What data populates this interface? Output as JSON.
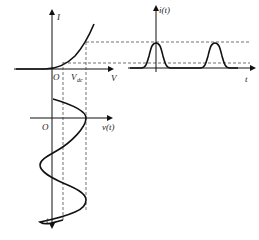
{
  "diagram": {
    "iv_plot": {
      "y_axis_label": "I",
      "x_axis_label": "V",
      "origin_label": "O",
      "bias_label": "V",
      "bias_subscript": "dc"
    },
    "current_plot": {
      "y_axis_label": "i(t)",
      "x_axis_label": "t"
    },
    "voltage_plot": {
      "origin_label": "O",
      "x_axis_label": "v(t)",
      "time_axis_label": "t"
    },
    "colors": {
      "stroke": "#111111",
      "dashed": "#333333",
      "background": "#ffffff"
    }
  }
}
